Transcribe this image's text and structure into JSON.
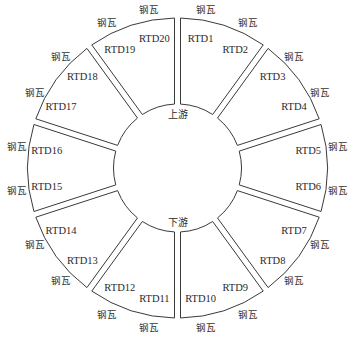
{
  "diagram": {
    "type": "thrust-bearing-pad-layout",
    "geometry": {
      "cx": 177.5,
      "cy": 168,
      "outer_r": 150,
      "inner_r": 64,
      "gap": 6,
      "segments": 10
    },
    "line_color": "#3a3a3a",
    "center_labels": {
      "upstream": "上游",
      "downstream": "下游"
    },
    "pad_label": "钢瓦",
    "segments": [
      {
        "index": 1,
        "sensors": [
          "RTD1",
          "RTD2"
        ]
      },
      {
        "index": 2,
        "sensors": [
          "RTD3",
          "RTD4"
        ]
      },
      {
        "index": 3,
        "sensors": [
          "RTD5",
          "RTD6"
        ]
      },
      {
        "index": 4,
        "sensors": [
          "RTD7",
          "RTD8"
        ]
      },
      {
        "index": 5,
        "sensors": [
          "RTD9",
          "RTD10"
        ]
      },
      {
        "index": 6,
        "sensors": [
          "RTD11",
          "RTD12"
        ]
      },
      {
        "index": 7,
        "sensors": [
          "RTD13",
          "RTD14"
        ]
      },
      {
        "index": 8,
        "sensors": [
          "RTD15",
          "RTD16"
        ]
      },
      {
        "index": 9,
        "sensors": [
          "RTD17",
          "RTD18"
        ]
      },
      {
        "index": 10,
        "sensors": [
          "RTD19",
          "RTD20"
        ]
      }
    ]
  }
}
